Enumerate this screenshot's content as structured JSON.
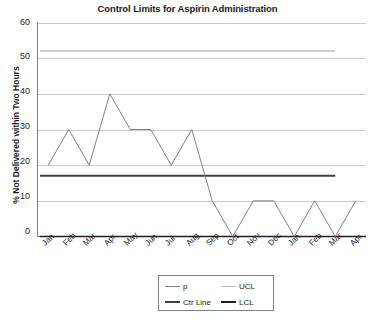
{
  "chart_data": {
    "type": "line",
    "title": "Control Limits for Aspirin Administration",
    "xlabel": "",
    "ylabel": "% Not Delivered within Two Hours",
    "ylim": [
      0,
      60
    ],
    "ytick_labels": [
      "0",
      "10",
      "20",
      "30",
      "40",
      "50",
      "60"
    ],
    "yticks": [
      0,
      10,
      20,
      30,
      40,
      50,
      60
    ],
    "grid": true,
    "legend_position": "bottom-center",
    "categories": [
      "Jan",
      "Feb",
      "Mar",
      "Apr",
      "May",
      "Jun",
      "Jul",
      "Aug",
      "Sep",
      "Oct",
      "Nov",
      "Dec",
      "Jan",
      "Feb",
      "Mar",
      "Apr"
    ],
    "series": [
      {
        "name": "p",
        "color": "#808285",
        "type": "line",
        "values": [
          20,
          30,
          20,
          40,
          30,
          30,
          20,
          30,
          10,
          0,
          10,
          10,
          0,
          10,
          0,
          10
        ]
      },
      {
        "name": "UCL",
        "color": "#bcbec0",
        "type": "constant-line",
        "value": 52,
        "span_end_index": 14
      },
      {
        "name": "Ctr Line",
        "color": "#414042",
        "type": "constant-line",
        "value": 17,
        "span_end_index": 14
      },
      {
        "name": "LCL",
        "color": "#231f20",
        "type": "constant-line",
        "value": 0,
        "span_end_index": 15
      }
    ]
  },
  "legend": {
    "items": [
      {
        "label": "p",
        "color": "#808285"
      },
      {
        "label": "UCL",
        "color": "#bcbec0"
      },
      {
        "label": "Ctr Line",
        "color": "#414042"
      },
      {
        "label": "LCL",
        "color": "#231f20"
      }
    ]
  },
  "colors": {
    "gridline": "#c8c9cb",
    "axis": "#808285",
    "plot_background": "#ffffff",
    "text": "#231f20"
  }
}
